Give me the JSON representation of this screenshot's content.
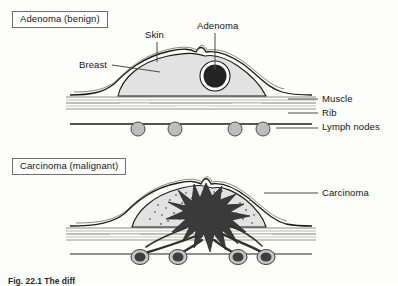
{
  "figure": {
    "caption": "Fig. 22.1   The diff",
    "panels": [
      {
        "id": "adenoma",
        "title": "Adenoma (benign)",
        "labels": [
          {
            "id": "skin",
            "text": "Skin"
          },
          {
            "id": "breast",
            "text": "Breast"
          },
          {
            "id": "adenoma",
            "text": "Adenoma"
          },
          {
            "id": "muscle",
            "text": "Muscle"
          },
          {
            "id": "rib",
            "text": "Rib"
          },
          {
            "id": "lymph_nodes",
            "text": "Lymph nodes"
          }
        ],
        "lymph_node_count": 4,
        "lymph_nodes_involved": false
      },
      {
        "id": "carcinoma",
        "title": "Carcinoma (malignant)",
        "labels": [
          {
            "id": "carcinoma",
            "text": "Carcinoma"
          }
        ],
        "lymph_node_count": 4,
        "lymph_nodes_involved": true
      }
    ]
  },
  "colors": {
    "background": "#fdfdfc",
    "outline": "#1a1a1a",
    "breast_fill": "#e2e2e2",
    "tumor_dark": "#3a3a3a",
    "adenoma_fill": "#232323",
    "node_fill": "#bdbdbd",
    "node_involved_fill": "#3f3f3f",
    "muscle_line": "#8e8e8e",
    "leader_line": "#4a4a4a",
    "text": "#141414"
  }
}
